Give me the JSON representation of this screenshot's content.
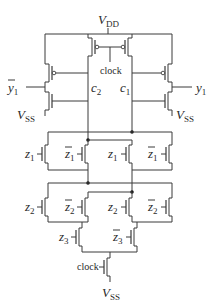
{
  "diagram": {
    "type": "circuit-schematic",
    "labels": {
      "vdd": {
        "main": "V",
        "sub": "DD"
      },
      "vss_left": {
        "main": "V",
        "sub": "SS"
      },
      "vss_right": {
        "main": "V",
        "sub": "SS"
      },
      "vss_bottom": {
        "main": "V",
        "sub": "SS"
      },
      "clock_top": "clock",
      "clock_bottom": "clock",
      "c2": {
        "main": "c",
        "sub": "2"
      },
      "c1": {
        "main": "c",
        "sub": "1"
      },
      "y1_bar": {
        "main": "y",
        "sub": "1",
        "overbar": true
      },
      "y1": {
        "main": "y",
        "sub": "1"
      }
    },
    "pulldown": {
      "row1": [
        {
          "main": "z",
          "sub": "1",
          "overbar": false
        },
        {
          "main": "z",
          "sub": "1",
          "overbar": true
        },
        {
          "main": "z",
          "sub": "1",
          "overbar": false
        },
        {
          "main": "z",
          "sub": "1",
          "overbar": true
        }
      ],
      "row2": [
        {
          "main": "z",
          "sub": "2",
          "overbar": false
        },
        {
          "main": "z",
          "sub": "2",
          "overbar": true
        },
        {
          "main": "z",
          "sub": "2",
          "overbar": false
        },
        {
          "main": "z",
          "sub": "2",
          "overbar": true
        }
      ],
      "row3": [
        {
          "main": "z",
          "sub": "3",
          "overbar": false
        },
        {
          "main": "z",
          "sub": "3",
          "overbar": true
        }
      ]
    },
    "colors": {
      "wire": "#3a3a3a",
      "text": "#2a2a2a",
      "background": "#ffffff"
    }
  }
}
